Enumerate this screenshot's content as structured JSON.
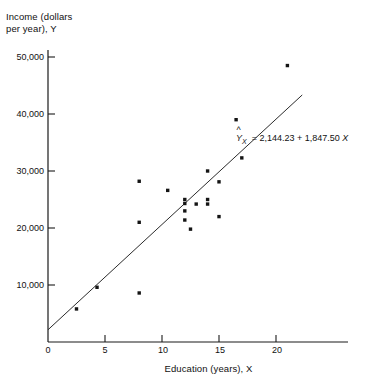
{
  "chart_data": {
    "type": "scatter",
    "title": "",
    "xlabel": "Education (years), X",
    "ylabel": "Income (dollars per year), Y",
    "ylabel_line1": "Income (dollars",
    "ylabel_line2": "per year), Y",
    "xlim": [
      0,
      23
    ],
    "ylim": [
      0,
      52000
    ],
    "grid": false,
    "legend": null,
    "xticks": [
      0,
      5,
      10,
      15,
      20
    ],
    "xtick_labels": [
      "0",
      "5",
      "10",
      "15",
      "20"
    ],
    "yticks": [
      10000,
      20000,
      30000,
      40000,
      50000
    ],
    "ytick_labels": [
      "10,000",
      "20,000",
      "30,000",
      "40,000",
      "50,000"
    ],
    "x": [
      2.5,
      4.3,
      8.0,
      8.0,
      8.0,
      10.5,
      12.0,
      12.0,
      12.0,
      12.0,
      12.5,
      13.0,
      14.0,
      14.0,
      14.0,
      15.0,
      15.0,
      16.5,
      17.0,
      21.0
    ],
    "y": [
      5800,
      9600,
      8600,
      21000,
      28200,
      26600,
      25000,
      24300,
      23000,
      21400,
      19800,
      24200,
      30000,
      25000,
      24200,
      28100,
      22000,
      39000,
      32300,
      48500
    ],
    "points": [
      {
        "x": 2.5,
        "y": 5800
      },
      {
        "x": 4.3,
        "y": 9600
      },
      {
        "x": 8.0,
        "y": 8600
      },
      {
        "x": 8.0,
        "y": 21000
      },
      {
        "x": 8.0,
        "y": 28200
      },
      {
        "x": 10.5,
        "y": 26600
      },
      {
        "x": 12.0,
        "y": 25000
      },
      {
        "x": 12.0,
        "y": 24300
      },
      {
        "x": 12.0,
        "y": 23000
      },
      {
        "x": 12.0,
        "y": 21400
      },
      {
        "x": 12.5,
        "y": 19800
      },
      {
        "x": 13.0,
        "y": 24200
      },
      {
        "x": 14.0,
        "y": 30000
      },
      {
        "x": 14.0,
        "y": 25000
      },
      {
        "x": 14.0,
        "y": 24200
      },
      {
        "x": 15.0,
        "y": 28100
      },
      {
        "x": 15.0,
        "y": 22000
      },
      {
        "x": 16.5,
        "y": 39000
      },
      {
        "x": 17.0,
        "y": 32300
      },
      {
        "x": 21.0,
        "y": 48500
      }
    ],
    "regression": {
      "intercept": 2144.23,
      "slope": 1847.5,
      "equation_text": "= 2,144.23 + 1,847.50",
      "response_symbol": "Y",
      "response_subscript": "X",
      "predictor_symbol": "X",
      "x_start": 0,
      "x_end": 22.3
    },
    "marker": {
      "shape": "square",
      "color": "#141414",
      "size_px": 3.4
    },
    "line_color": "#2b2b2b",
    "axis_color": "#1a1a1a",
    "background": "#ffffff"
  }
}
